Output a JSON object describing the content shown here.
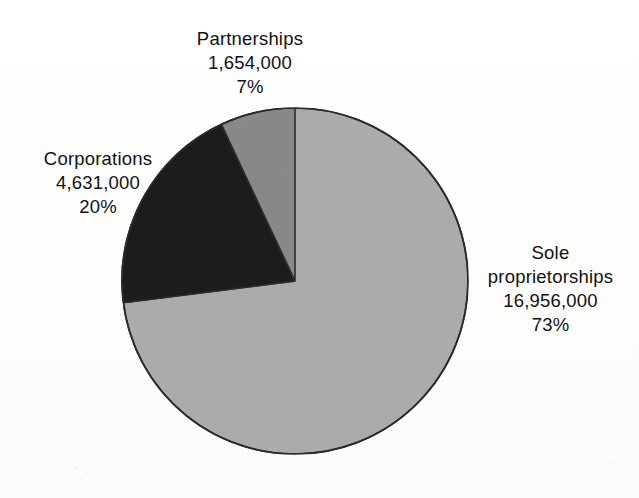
{
  "figure": {
    "background_color": "#ffffff",
    "text_color": "#111111",
    "outline_color": "#2a2a2a"
  },
  "labels": {
    "partnerships": {
      "name": "Partnerships",
      "value": "1,654,000",
      "percent": "7%"
    },
    "corporations": {
      "name": "Corporations",
      "value": "4,631,000",
      "percent": "20%"
    },
    "sole": {
      "name_line1": "Sole",
      "name_line2": "proprietorships",
      "value": "16,956,000",
      "percent": "73%"
    }
  },
  "chart_data": {
    "type": "pie",
    "title": "",
    "xlabel": "",
    "ylabel": "",
    "legend_position": "none",
    "grid": false,
    "start_angle_deg": 90,
    "direction": "clockwise",
    "center": {
      "x": 295,
      "y": 281
    },
    "radius": 173,
    "categories": [
      "Sole proprietorships",
      "Corporations",
      "Partnerships"
    ],
    "values": [
      16956000,
      4631000,
      1654000
    ],
    "percents": [
      73,
      20,
      7
    ],
    "value_labels": [
      "16,956,000",
      "4,631,000",
      "1,654,000"
    ],
    "percent_labels": [
      "73%",
      "20%",
      "7%"
    ],
    "colors": [
      "#adadad",
      "#1c1c1c",
      "#8a8a8a"
    ],
    "total": 23241000,
    "slices": [
      {
        "label": "Sole proprietorships",
        "value": 16956000,
        "value_label": "16,956,000",
        "percent": 73,
        "percent_label": "73%",
        "color": "#adadad",
        "start_deg": 0,
        "end_deg": 262.8
      },
      {
        "label": "Corporations",
        "value": 4631000,
        "value_label": "4,631,000",
        "percent": 20,
        "percent_label": "20%",
        "color": "#1c1c1c",
        "start_deg": 262.8,
        "end_deg": 334.8
      },
      {
        "label": "Partnerships",
        "value": 1654000,
        "value_label": "1,654,000",
        "percent": 7,
        "percent_label": "7%",
        "color": "#8a8a8a",
        "start_deg": 334.8,
        "end_deg": 360
      }
    ]
  }
}
